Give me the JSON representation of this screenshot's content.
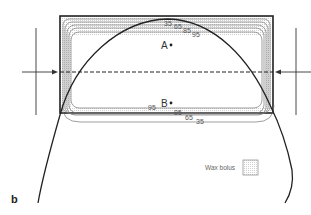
{
  "figure": {
    "panel_label": "b",
    "points": [
      {
        "label": "A",
        "x": 171,
        "y": 45
      },
      {
        "label": "B",
        "x": 171,
        "y": 103
      }
    ],
    "isodose_labels_top": [
      "35",
      "65",
      "85",
      "95"
    ],
    "isodose_labels_bottom": [
      "95",
      "85",
      "65",
      "35"
    ],
    "legend": {
      "label": "Wax bolus"
    },
    "colors": {
      "line": "#222222",
      "contour": "#777777",
      "bolus_fill": "#e6e6e6"
    }
  }
}
